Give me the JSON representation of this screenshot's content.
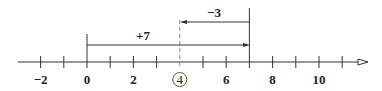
{
  "number_line": {
    "tick_labels": [
      "−2",
      "0",
      "2",
      "4",
      "6",
      "8",
      "10"
    ],
    "circled_label": "4",
    "range": [
      -3,
      11
    ]
  },
  "jumps": {
    "first": {
      "label": "+7",
      "from": 0,
      "to": 7
    },
    "second": {
      "label": "−3",
      "from": 7,
      "to": 4
    }
  },
  "colors": {
    "line": "#333333",
    "dashed": "#888888"
  }
}
